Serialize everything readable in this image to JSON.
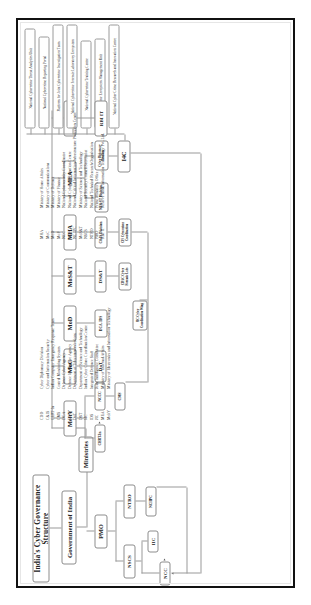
{
  "poster": {
    "title": "India's Cyber Governance Structure",
    "root": "Government of India",
    "ministries_label": "Ministries"
  },
  "branches": {
    "pmo": {
      "label": "PMO",
      "children": [
        {
          "label": "NSCS",
          "children": [
            {
              "label": "NCC"
            },
            {
              "label": "IIC"
            }
          ]
        },
        {
          "label": "NTRO",
          "children": [
            {
              "label": "NCIIPC"
            }
          ]
        }
      ]
    }
  },
  "ministries": [
    {
      "label": "MeitY",
      "children": [
        {
          "label": "CERT-In"
        },
        {
          "label": "NCCC"
        },
        {
          "label": "CMS"
        }
      ]
    },
    {
      "label": "MoC",
      "children": [
        {
          "label": "DoT"
        }
      ]
    },
    {
      "label": "MoD",
      "children": [
        {
          "label": "DCA, IDS"
        }
      ]
    },
    {
      "label": "MoS&T",
      "children": [
        {
          "label": "DS&T"
        },
        {
          "label": "CDAC Cyber Forensic Labs"
        }
      ]
    },
    {
      "label": "MHA",
      "children": [
        {
          "label": "C&IS Division"
        },
        {
          "label": "CIS Cybercrime Coordination"
        }
      ]
    },
    {
      "label": "MEA",
      "children": [
        {
          "label": "NE&ST Division"
        },
        {
          "label": "Cyber Diplomacy Division"
        },
        {
          "label": "I4C"
        }
      ]
    },
    {
      "label": "MoF",
      "children": [
        {
          "label": "RBI IT"
        }
      ]
    }
  ],
  "i4c_verticals": [
    "National Cybercrime Threat Analytics Unit",
    "National Cybercrime Reporting Portal",
    "Platform for Joint Cybercrime Investigation Team",
    "National Cybercrime Forensic Laboratory Ecosystem",
    "National Cybercrime Training Centre",
    "Cybercrime Ecosystem Management Unit",
    "National Cyber Crime Research and Innovation Centre"
  ],
  "left_tree_extra": [
    {
      "label": "JIC Cyber Coordination Wing"
    }
  ],
  "legend": {
    "column1": [
      {
        "abbr": "CDD",
        "full": "Cyber Diplomacy Division"
      },
      {
        "abbr": "C&IS",
        "full": "Cyber and Information Security"
      },
      {
        "abbr": "CERT-In",
        "full": "Indian Computer Emergency Response Team"
      },
      {
        "abbr": "CMS",
        "full": "Central Monitoring System"
      },
      {
        "abbr": "DCA",
        "full": "Defence Cyber Agency"
      },
      {
        "abbr": "DIA",
        "full": "Defence Intelligence Agency"
      },
      {
        "abbr": "DoT",
        "full": "Department of Telecommunications"
      },
      {
        "abbr": "DST",
        "full": "Department of Science and Technology"
      },
      {
        "abbr": "I4C",
        "full": "Indian Cyber Crime Coordination Centre"
      },
      {
        "abbr": "IDS",
        "full": "Integrated Defence Staff"
      },
      {
        "abbr": "JIC",
        "full": "Joint Intelligence Committee"
      },
      {
        "abbr": "MEA",
        "full": "Ministry of External Affairs"
      },
      {
        "abbr": "MeitY",
        "full": "Ministry of Electronics and Information Technology"
      }
    ],
    "column2": [
      {
        "abbr": "MHA",
        "full": "Ministry of Home Affairs"
      },
      {
        "abbr": "MoC",
        "full": "Ministry of Communications"
      },
      {
        "abbr": "MoD",
        "full": "Ministry of Defence"
      },
      {
        "abbr": "MoF",
        "full": "Ministry of Finance"
      },
      {
        "abbr": "NCC",
        "full": "National Cybersecurity Coordinator"
      },
      {
        "abbr": "NCCC",
        "full": "National Cyber Coordination Centre"
      },
      {
        "abbr": "NCIIPC",
        "full": "National Critical Information Infrastructure Protection Centre"
      },
      {
        "abbr": "MoS&T",
        "full": "Ministry of Science and Technology"
      },
      {
        "abbr": "NSCS",
        "full": "National Security Council Secretariat"
      },
      {
        "abbr": "NTRO",
        "full": "National Technical Research Organisation"
      },
      {
        "abbr": "PMO",
        "full": "Prime Minister's Office"
      },
      {
        "abbr": "RBI IT",
        "full": "Reserve Bank Information Technology Pvt. Ltd."
      }
    ]
  }
}
